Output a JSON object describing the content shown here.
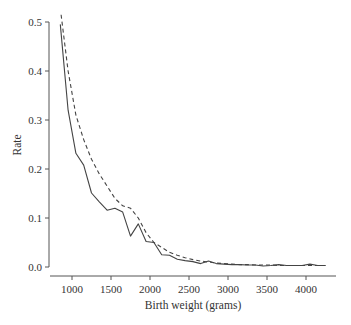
{
  "chart_data": {
    "type": "line",
    "title": "",
    "xlabel": "Birth weight (grams)",
    "ylabel": "Rate",
    "xlim": [
      700,
      4400
    ],
    "ylim": [
      0.0,
      0.52
    ],
    "xticks": [
      1000,
      1500,
      2000,
      2500,
      3000,
      3500,
      4000
    ],
    "yticks": [
      0.0,
      0.1,
      0.2,
      0.3,
      0.4,
      0.5
    ],
    "xtick_labels": [
      "1000",
      "1500",
      "2000",
      "2500",
      "3000",
      "3500",
      "4000"
    ],
    "ytick_labels": [
      "0.0",
      "0.1",
      "0.2",
      "0.3",
      "0.4",
      "0.5"
    ],
    "grid": false,
    "legend": null,
    "series": [
      {
        "name": "observed",
        "style": "solid",
        "x": [
          850,
          950,
          1050,
          1150,
          1250,
          1350,
          1450,
          1550,
          1650,
          1750,
          1850,
          1950,
          2050,
          2150,
          2250,
          2350,
          2450,
          2550,
          2650,
          2750,
          2850,
          2950,
          3050,
          3150,
          3250,
          3350,
          3450,
          3550,
          3650,
          3750,
          3850,
          3950,
          4050,
          4150,
          4250
        ],
        "y": [
          0.495,
          0.32,
          0.232,
          0.208,
          0.151,
          0.133,
          0.116,
          0.12,
          0.112,
          0.063,
          0.088,
          0.052,
          0.05,
          0.025,
          0.024,
          0.016,
          0.013,
          0.011,
          0.007,
          0.012,
          0.007,
          0.006,
          0.005,
          0.005,
          0.004,
          0.004,
          0.002,
          0.003,
          0.005,
          0.003,
          0.003,
          0.003,
          0.006,
          0.003,
          0.003
        ]
      },
      {
        "name": "fitted",
        "style": "dashed",
        "x": [
          860,
          950,
          1050,
          1150,
          1250,
          1350,
          1450,
          1550,
          1650,
          1750,
          1850,
          1950,
          2050,
          2150,
          2250,
          2350,
          2450,
          2550,
          2650,
          2750,
          2850,
          2950,
          3050,
          3150,
          3250,
          3350,
          3450,
          3550,
          3650,
          3750,
          3850,
          3950,
          4050,
          4150,
          4250
        ],
        "y": [
          0.515,
          0.4,
          0.31,
          0.26,
          0.22,
          0.19,
          0.165,
          0.14,
          0.125,
          0.12,
          0.1,
          0.07,
          0.05,
          0.04,
          0.03,
          0.024,
          0.019,
          0.015,
          0.012,
          0.01,
          0.008,
          0.007,
          0.006,
          0.005,
          0.005,
          0.004,
          0.004,
          0.004,
          0.003,
          0.003,
          0.003,
          0.003,
          0.003,
          0.003,
          0.003
        ]
      }
    ]
  },
  "plot": {
    "line_color": "#444444",
    "axis_color": "#555555",
    "background": "#ffffff"
  }
}
